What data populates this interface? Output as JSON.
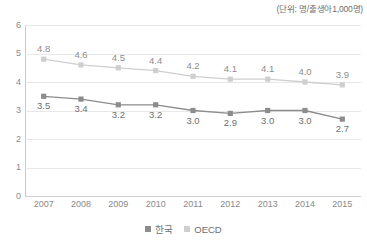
{
  "caption": {
    "unit_note": "(단위: 명/출생아1,000명)"
  },
  "chart_data": {
    "type": "line",
    "title": "",
    "subtitle": "",
    "xlabel": "",
    "ylabel": "",
    "unit_note": "(단위: 명/출생아1,000명)",
    "categories": [
      "2007",
      "2008",
      "2009",
      "2010",
      "2011",
      "2012",
      "2013",
      "2014",
      "2015"
    ],
    "x": [
      2007,
      2008,
      2009,
      2010,
      2011,
      2012,
      2013,
      2014,
      2015
    ],
    "series": [
      {
        "name": "한국",
        "color": "#8c8c8c",
        "marker": "square",
        "label_position": "below",
        "values": [
          3.5,
          3.4,
          3.2,
          3.2,
          3.0,
          2.9,
          3.0,
          3.0,
          2.7
        ],
        "value_labels": [
          "3.5",
          "3.4",
          "3.2",
          "3.2",
          "3.0",
          "2.9",
          "3.0",
          "3.0",
          "2.7"
        ]
      },
      {
        "name": "OECD",
        "color": "#cfcfcf",
        "marker": "square",
        "label_position": "above",
        "values": [
          4.8,
          4.6,
          4.5,
          4.4,
          4.2,
          4.1,
          4.1,
          4.0,
          3.9
        ],
        "value_labels": [
          "4.8",
          "4.6",
          "4.5",
          "4.4",
          "4.2",
          "4.1",
          "4.1",
          "4.0",
          "3.9"
        ]
      }
    ],
    "ylim": [
      0,
      6
    ],
    "yticks": [
      0,
      1,
      2,
      3,
      4,
      5,
      6
    ],
    "ytick_labels": [
      "0",
      "1",
      "2",
      "3",
      "4",
      "5",
      "6"
    ],
    "grid": true,
    "grid_axis": "y",
    "legend_position": "bottom",
    "legend_entries": [
      {
        "label": "한국",
        "color": "#8c8c8c"
      },
      {
        "label": "OECD",
        "color": "#cfcfcf"
      }
    ]
  },
  "legend": {
    "items": [
      {
        "label": "한국",
        "color": "#8c8c8c"
      },
      {
        "label": "OECD",
        "color": "#cfcfcf"
      }
    ]
  },
  "colors": {
    "korea": "#8c8c8c",
    "oecd": "#cfcfcf",
    "grid": "#e8e8e8",
    "axis": "#c9c9c9",
    "tick_text": "#8a8a8a",
    "background": "#ffffff"
  }
}
